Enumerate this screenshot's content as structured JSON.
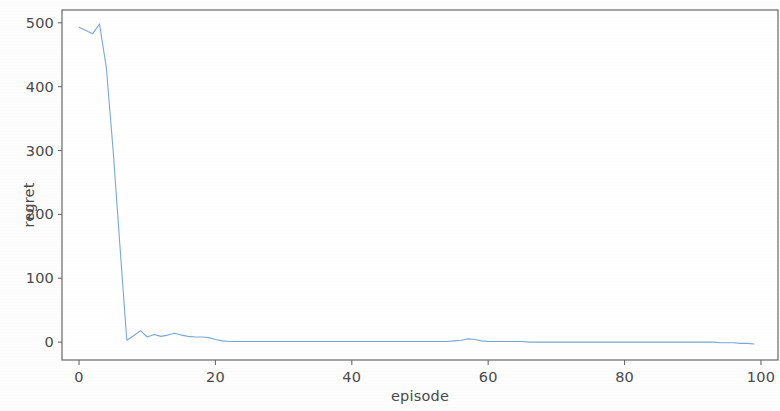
{
  "chart_data": {
    "type": "line",
    "title": "",
    "xlabel": "episode",
    "ylabel": "regret",
    "xlim": [
      -2.5,
      102.5
    ],
    "ylim": [
      -28,
      520
    ],
    "xticks": [
      0,
      20,
      40,
      60,
      80,
      100
    ],
    "xtick_labels": [
      "0",
      "20",
      "40",
      "60",
      "80",
      "100"
    ],
    "yticks": [
      0,
      100,
      200,
      300,
      400,
      500
    ],
    "ytick_labels": [
      "0",
      "100",
      "200",
      "300",
      "400",
      "500"
    ],
    "grid": false,
    "legend": null,
    "series": [
      {
        "name": "regret",
        "color": "#7BA7D7",
        "linewidth": 1.1,
        "x": [
          0,
          1,
          2,
          3,
          4,
          5,
          6,
          7,
          8,
          9,
          10,
          11,
          12,
          13,
          14,
          15,
          16,
          17,
          18,
          19,
          20,
          21,
          22,
          23,
          24,
          25,
          26,
          27,
          28,
          29,
          30,
          31,
          32,
          33,
          34,
          35,
          36,
          37,
          38,
          39,
          40,
          41,
          42,
          43,
          44,
          45,
          46,
          47,
          48,
          49,
          50,
          51,
          52,
          53,
          54,
          55,
          56,
          57,
          58,
          59,
          60,
          61,
          62,
          63,
          64,
          65,
          66,
          67,
          68,
          69,
          70,
          71,
          72,
          73,
          74,
          75,
          76,
          77,
          78,
          79,
          80,
          81,
          82,
          83,
          84,
          85,
          86,
          87,
          88,
          89,
          90,
          91,
          92,
          93,
          94,
          95,
          96,
          97,
          98,
          99
        ],
        "y": [
          493,
          488,
          483,
          498,
          430,
          300,
          150,
          3,
          10,
          18,
          8,
          12,
          9,
          11,
          14,
          11,
          9,
          8,
          8,
          7,
          4,
          2,
          1,
          1,
          1,
          1,
          1,
          1,
          1,
          1,
          1,
          1,
          1,
          1,
          1,
          1,
          1,
          1,
          1,
          1,
          1,
          1,
          1,
          1,
          1,
          1,
          1,
          1,
          1,
          1,
          1,
          1,
          1,
          1,
          1,
          2,
          3,
          5,
          4,
          2,
          1,
          1,
          1,
          1,
          1,
          1,
          0,
          0,
          0,
          0,
          0,
          0,
          0,
          0,
          0,
          0,
          0,
          0,
          0,
          0,
          0,
          0,
          0,
          0,
          0,
          0,
          0,
          0,
          0,
          0,
          0,
          0,
          0,
          0,
          -1,
          -1,
          -1,
          -2,
          -2,
          -3
        ]
      }
    ],
    "notes": {
      "initial_regret": 493,
      "peak_regret": 498,
      "peak_episode": 3,
      "converged_regret": 0,
      "convergence_episode": 22,
      "final_regret": -3,
      "final_episode": 99
    }
  },
  "axes": {
    "spine_color": "#5a5a5a",
    "tick_color": "#6a6a6a",
    "label_color": "#4a4a4a",
    "frame": {
      "left": 62,
      "top": 10,
      "right": 778,
      "bottom": 360
    }
  }
}
